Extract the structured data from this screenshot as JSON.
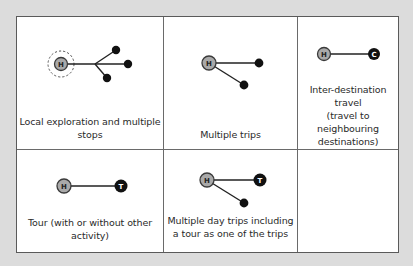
{
  "diagram": {
    "type": "trip-pattern-matrix",
    "cells": [
      {
        "id": "local-exploration",
        "caption_lines": [
          "Local exploration and multiple",
          "stops"
        ],
        "nodes": [
          {
            "label": "H",
            "kind": "home",
            "dashed_halo": true
          },
          {
            "label": "",
            "kind": "stop"
          },
          {
            "label": "",
            "kind": "stop"
          },
          {
            "label": "",
            "kind": "stop"
          }
        ]
      },
      {
        "id": "multiple-trips",
        "caption_lines": [
          "Multiple trips"
        ],
        "nodes": [
          {
            "label": "H",
            "kind": "home"
          },
          {
            "label": "",
            "kind": "stop"
          },
          {
            "label": "",
            "kind": "stop"
          }
        ]
      },
      {
        "id": "inter-destination",
        "caption_lines": [
          "Inter-destination",
          "travel",
          "(travel to",
          "neighbouring",
          "destinations)"
        ],
        "nodes": [
          {
            "label": "H",
            "kind": "home"
          },
          {
            "label": "C",
            "kind": "destination"
          }
        ]
      },
      {
        "id": "tour",
        "caption_lines": [
          "Tour (with or without other",
          "activity)"
        ],
        "nodes": [
          {
            "label": "H",
            "kind": "home"
          },
          {
            "label": "T",
            "kind": "tour"
          }
        ]
      },
      {
        "id": "multiple-day-trips-with-tour",
        "caption_lines": [
          "Multiple day trips including",
          "a tour as one of the trips"
        ],
        "nodes": [
          {
            "label": "H",
            "kind": "home"
          },
          {
            "label": "T",
            "kind": "tour"
          },
          {
            "label": "",
            "kind": "stop"
          }
        ]
      },
      {
        "id": "empty",
        "caption_lines": [],
        "nodes": []
      }
    ]
  },
  "colors": {
    "page_background": "#dcdcdc",
    "cell_background": "#ffffff",
    "grid_line": "#5a5a5a",
    "home_node_fill": "#a9a9a9",
    "dark_node_fill": "#111111",
    "text": "#2a2a2a"
  }
}
